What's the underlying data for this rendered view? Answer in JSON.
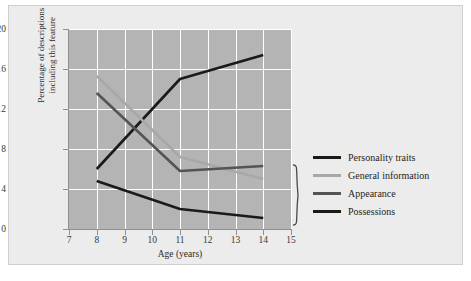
{
  "chart_data": {
    "type": "line",
    "title": "",
    "xlabel": "Age (years)",
    "ylabel": "Percentage of descriptions including this feature",
    "x": [
      8,
      11,
      14
    ],
    "xlim": [
      7,
      15
    ],
    "ylim": [
      0,
      20
    ],
    "xticks": [
      "7",
      "8",
      "9",
      "10",
      "11",
      "12",
      "13",
      "14",
      "15"
    ],
    "yticks": [
      "0",
      "4",
      "8",
      "12",
      "16",
      "20"
    ],
    "grid": true,
    "legend_position": "right",
    "series": [
      {
        "name": "Personality traits",
        "values": [
          6.0,
          15.0,
          17.4
        ],
        "color": "#1a1a1a"
      },
      {
        "name": "General information",
        "values": [
          15.3,
          7.2,
          5.0
        ],
        "color": "#a8a8a8"
      },
      {
        "name": "Appearance",
        "values": [
          13.6,
          5.8,
          6.3
        ],
        "color": "#545454"
      },
      {
        "name": "Possessions",
        "values": [
          4.8,
          2.0,
          1.1
        ],
        "color": "#1a1a1a"
      }
    ],
    "annotations": [
      {
        "type": "brace",
        "label": "",
        "y_from": 1.0,
        "y_to": 6.5,
        "x": 14.2
      }
    ]
  },
  "axes": {
    "x_title": "Age (years)",
    "y_title_line1": "Percentage of descriptions",
    "y_title_line2": "including this feature",
    "x_ticks": [
      {
        "value": 7,
        "label": "7"
      },
      {
        "value": 8,
        "label": "8"
      },
      {
        "value": 9,
        "label": "9"
      },
      {
        "value": 10,
        "label": "10"
      },
      {
        "value": 11,
        "label": "11"
      },
      {
        "value": 12,
        "label": "12"
      },
      {
        "value": 13,
        "label": "13"
      },
      {
        "value": 14,
        "label": "14"
      },
      {
        "value": 15,
        "label": "15"
      }
    ],
    "y_ticks": [
      {
        "value": 0,
        "label": "0"
      },
      {
        "value": 4,
        "label": "4"
      },
      {
        "value": 8,
        "label": "8"
      },
      {
        "value": 12,
        "label": "12"
      },
      {
        "value": 16,
        "label": "16"
      },
      {
        "value": 20,
        "label": "20"
      }
    ]
  },
  "legend": {
    "items": [
      {
        "label": "Personality traits",
        "color": "#1a1a1a"
      },
      {
        "label": "General information",
        "color": "#a8a8a8"
      },
      {
        "label": "Appearance",
        "color": "#545454"
      },
      {
        "label": "Possessions",
        "color": "#1a1a1a"
      }
    ]
  },
  "colors": {
    "figure_background": "#ececec",
    "plot_background": "#b4b4b4",
    "gridline": "#ffffff",
    "axis": "#8f8f8f",
    "text": "#2a2a2a"
  }
}
